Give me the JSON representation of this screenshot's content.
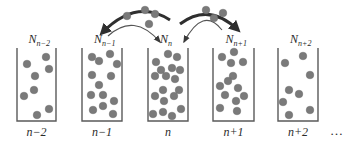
{
  "diagram": {
    "colors": {
      "wall": "#5a5a5a",
      "particle": "#7a7a7a",
      "arrow_thick": "#2f2f2f",
      "arrow_thin": "#555555",
      "text": "#2a2a2a"
    },
    "ellipsis": "…",
    "boxes": [
      {
        "index_label": "n−2",
        "count_base": "N",
        "count_sub": "n−2",
        "x": 17,
        "w": 39,
        "dots": [
          [
            27,
            64
          ],
          [
            46,
            57
          ],
          [
            49,
            69
          ],
          [
            35,
            76
          ],
          [
            34,
            90
          ],
          [
            24,
            96
          ],
          [
            49,
            109
          ],
          [
            37,
            115
          ]
        ]
      },
      {
        "index_label": "n−1",
        "count_base": "N",
        "count_sub": "n−1",
        "x": 82,
        "w": 40,
        "dots": [
          [
            92,
            57
          ],
          [
            99,
            61
          ],
          [
            110,
            54
          ],
          [
            117,
            64
          ],
          [
            92,
            75
          ],
          [
            111,
            76
          ],
          [
            99,
            85
          ],
          [
            91,
            95
          ],
          [
            103,
            95
          ],
          [
            114,
            101
          ],
          [
            93,
            110
          ],
          [
            103,
            106
          ],
          [
            113,
            114
          ]
        ]
      },
      {
        "index_label": "n",
        "count_base": "N",
        "count_sub": "n",
        "x": 148,
        "w": 40,
        "dots": [
          [
            168,
            54
          ],
          [
            177,
            57
          ],
          [
            156,
            62
          ],
          [
            161,
            70
          ],
          [
            172,
            68
          ],
          [
            180,
            70
          ],
          [
            155,
            76
          ],
          [
            166,
            76
          ],
          [
            175,
            79
          ],
          [
            163,
            90
          ],
          [
            179,
            90
          ],
          [
            155,
            96
          ],
          [
            174,
            96
          ],
          [
            164,
            101
          ],
          [
            153,
            114
          ],
          [
            163,
            112
          ],
          [
            172,
            116
          ],
          [
            181,
            109
          ]
        ]
      },
      {
        "index_label": "n+1",
        "count_base": "N",
        "count_sub": "n+1",
        "x": 213,
        "w": 41,
        "dots": [
          [
            222,
            57
          ],
          [
            234,
            52
          ],
          [
            231,
            63
          ],
          [
            243,
            62
          ],
          [
            233,
            76
          ],
          [
            228,
            81
          ],
          [
            220,
            86
          ],
          [
            238,
            88
          ],
          [
            225,
            95
          ],
          [
            244,
            96
          ],
          [
            236,
            101
          ],
          [
            220,
            108
          ],
          [
            237,
            111
          ]
        ]
      },
      {
        "index_label": "n+2",
        "count_base": "N",
        "count_sub": "n+2",
        "x": 278,
        "w": 40,
        "dots": [
          [
            285,
            63
          ],
          [
            303,
            56
          ],
          [
            310,
            75
          ],
          [
            289,
            90
          ],
          [
            299,
            94
          ],
          [
            283,
            102
          ],
          [
            310,
            110
          ],
          [
            289,
            115
          ]
        ]
      }
    ],
    "transfers": [
      {
        "name": "exchange-n-1-to-n",
        "thick_from": [
          170,
          20
        ],
        "thick_to": [
          102,
          33
        ],
        "thin_from": [
          108,
          36
        ],
        "thin_to": [
          160,
          42
        ],
        "particles": [
          [
            127,
            16
          ],
          [
            145,
            10
          ],
          [
            155,
            14
          ],
          [
            149,
            24
          ]
        ]
      },
      {
        "name": "exchange-n-to-n+1",
        "thick_from": [
          180,
          24
        ],
        "thick_to": [
          238,
          30
        ],
        "thin_from": [
          222,
          30
        ],
        "thin_to": [
          184,
          42
        ],
        "particles": [
          [
            206,
            10
          ],
          [
            223,
            13
          ],
          [
            214,
            18
          ]
        ]
      }
    ]
  }
}
